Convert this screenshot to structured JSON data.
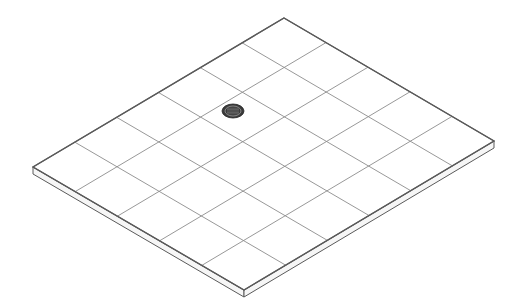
{
  "diagram": {
    "type": "isometric-floor-slab",
    "grid": {
      "tiles_short_edge": 5,
      "tiles_long_edge": 6
    },
    "corners": {
      "top": [
        284,
        18
      ],
      "right": [
        494,
        141
      ],
      "bottom": [
        244,
        290
      ],
      "left": [
        33,
        167
      ]
    },
    "slab_thickness_px": 7,
    "drain": {
      "label": "floor-drain",
      "center": [
        233,
        111
      ],
      "rx": 11,
      "ry": 7,
      "color": "#3a3a3a"
    },
    "colors": {
      "background": "#ffffff",
      "outline": "#5a5a5a",
      "grid": "#8c8c8c",
      "side_face": "#f6f6f6"
    }
  }
}
